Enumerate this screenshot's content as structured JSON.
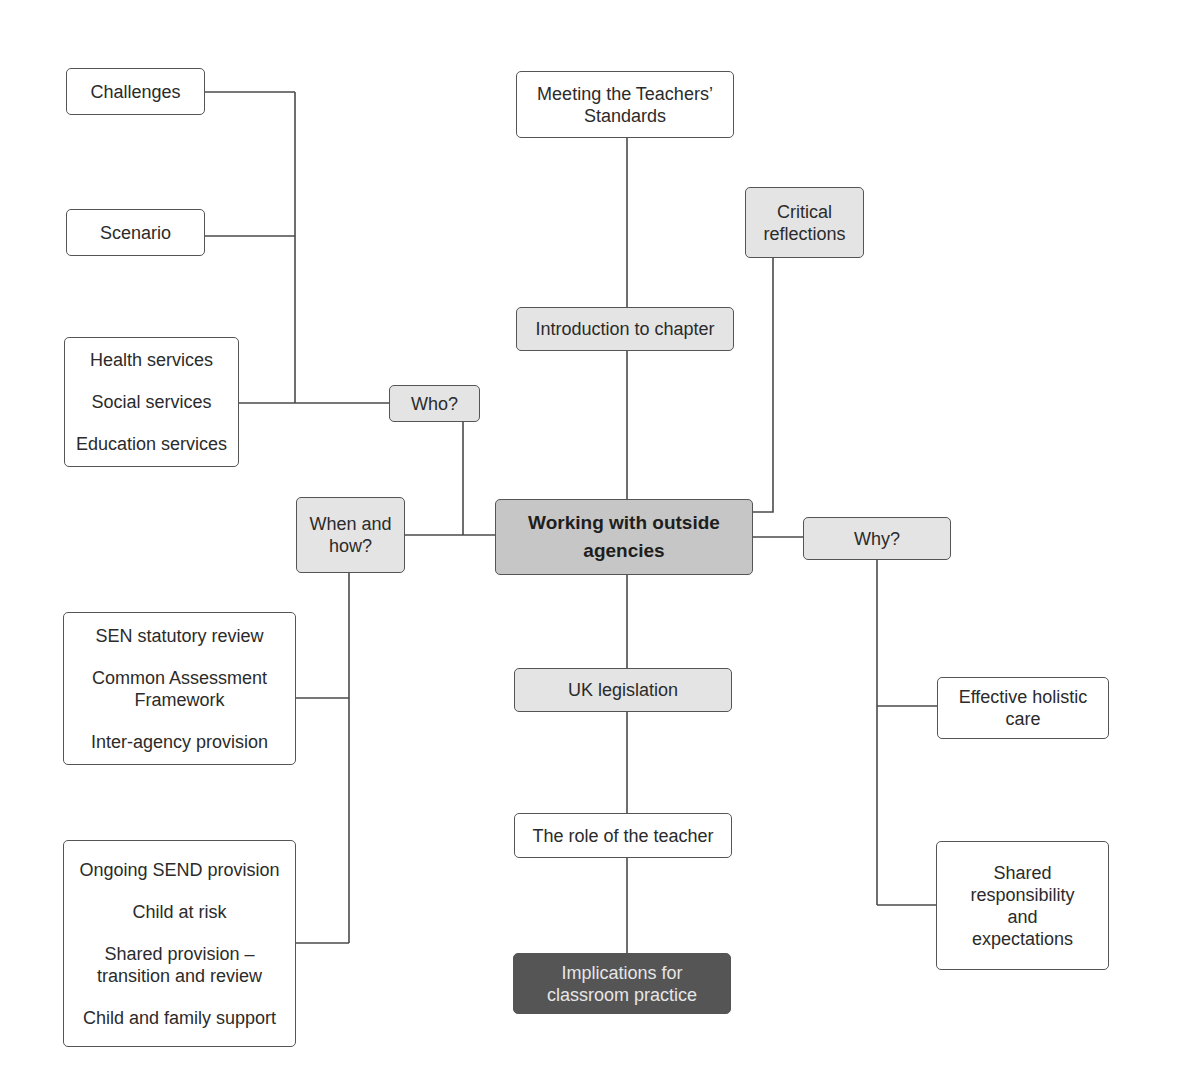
{
  "diagram": {
    "title": "Working with outside agencies",
    "colors": {
      "line": "#4a4a4a",
      "white_box": "#ffffff",
      "light_box": "#e4e4e4",
      "center_box": "#c6c6c6",
      "dark_box": "#555555",
      "dark_text": "#e6e6e6"
    },
    "center": {
      "lines": [
        "Working with outside",
        "agencies"
      ]
    },
    "top": {
      "standards": {
        "lines": [
          "Meeting the Teachers’",
          "Standards"
        ]
      },
      "introduction": {
        "label": "Introduction to chapter"
      },
      "critical": {
        "lines": [
          "Critical",
          "reflections"
        ]
      }
    },
    "who": {
      "label": "Who?",
      "challenges": "Challenges",
      "scenario": "Scenario",
      "services": [
        "Health services",
        "Social services",
        "Education services"
      ]
    },
    "when_how": {
      "lines": [
        "When and",
        "how?"
      ],
      "group1": {
        "items": [
          "SEN statutory review",
          "Common Assessment",
          "Framework",
          "Inter-agency provision"
        ]
      },
      "group2": {
        "items": [
          "Ongoing SEND provision",
          "Child at risk",
          "Shared provision –",
          "transition and review",
          "Child and family support"
        ]
      }
    },
    "why": {
      "label": "Why?",
      "holistic": [
        "Effective holistic",
        "care"
      ],
      "shared": [
        "Shared",
        "responsibility",
        "and",
        "expectations"
      ]
    },
    "bottom": {
      "legislation": "UK legislation",
      "role": "The role of the teacher",
      "implications": [
        "Implications for",
        "classroom practice"
      ]
    }
  }
}
